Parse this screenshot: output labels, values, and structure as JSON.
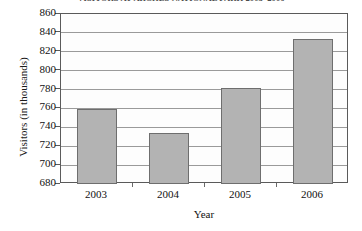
{
  "chart_data": {
    "type": "bar",
    "title": "VISITORS AT ARCHES NATIONAL PARK 2003–2006",
    "xlabel": "Year",
    "ylabel": "Visitors (in thousands)",
    "categories": [
      "2003",
      "2004",
      "2005",
      "2006"
    ],
    "values": [
      759,
      734,
      782,
      834
    ],
    "ylim": [
      680,
      860
    ],
    "ytick_labels": [
      "680",
      "700",
      "720",
      "740",
      "760",
      "780",
      "800",
      "820",
      "840",
      "860"
    ],
    "ytick_values": [
      680,
      700,
      720,
      740,
      760,
      780,
      800,
      820,
      840,
      860
    ],
    "grid": "horizontal",
    "legend": null,
    "series": [
      {
        "name": "Visitors (in thousands)",
        "values": [
          759,
          734,
          782,
          834
        ]
      }
    ],
    "colors": {
      "bar_fill": "#b3b3b3",
      "bar_border": "#6e6e6e",
      "gridline": "#9a9a9a",
      "frame": "#5a5a5a",
      "text": "#111111",
      "title_text": "#4d4d4d",
      "plot_background": "#fdfdfd",
      "page_background": "#ffffff"
    }
  }
}
